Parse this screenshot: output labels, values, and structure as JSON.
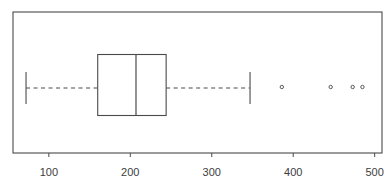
{
  "figure": {
    "background": "#ffffff",
    "line_color": "#4a4a4a",
    "text_color": "#3d3d3d",
    "title": ""
  },
  "chart_data": {
    "type": "boxplot",
    "orientation": "horizontal",
    "title": "",
    "xlabel": "",
    "ylabel": "",
    "x_ticks": [
      100,
      200,
      300,
      400,
      500
    ],
    "x_tick_labels": [
      "100",
      "200",
      "300",
      "400",
      "500"
    ],
    "xlim": [
      56,
      509
    ],
    "grid": false,
    "frame": true,
    "legend": "none",
    "whisker_line_style": "dashed",
    "series": [
      {
        "name": "box-1",
        "lower_whisker": 72,
        "q1": 160,
        "median": 207,
        "q3": 244,
        "upper_whisker": 347,
        "outliers": [
          386,
          446,
          473,
          485
        ]
      }
    ]
  }
}
